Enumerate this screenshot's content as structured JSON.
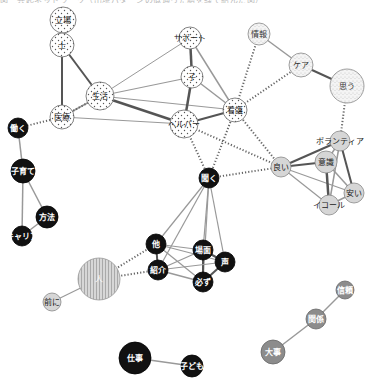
{
  "caption": "図　共起ネットワーク（出現パターンの似通った語を線で結んだ図）",
  "legend_patterns": {
    "dotted": "#ffffff",
    "stippled": "#f2f2f2",
    "light_gray": "#d6d6d6",
    "black": "#111111",
    "striped": "#c9c9c9",
    "medium_gray": "#8c8c8c"
  },
  "nodes": [
    {
      "id": "tachiba",
      "label": "立場",
      "x": 63,
      "y": 20,
      "r": 13,
      "style": "dotted"
    },
    {
      "id": "shi",
      "label": "士",
      "x": 62,
      "y": 45,
      "r": 12,
      "style": "dotted"
    },
    {
      "id": "seikatsu",
      "label": "生活",
      "x": 100,
      "y": 96,
      "r": 14,
      "style": "dotted"
    },
    {
      "id": "iryou",
      "label": "医療",
      "x": 62,
      "y": 117,
      "r": 12,
      "style": "dotted"
    },
    {
      "id": "support",
      "label": "サポート",
      "x": 190,
      "y": 38,
      "r": 11,
      "style": "dotted"
    },
    {
      "id": "ko",
      "label": "子",
      "x": 192,
      "y": 77,
      "r": 11,
      "style": "dotted"
    },
    {
      "id": "kango",
      "label": "看護",
      "x": 235,
      "y": 110,
      "r": 12,
      "style": "dotted"
    },
    {
      "id": "helper",
      "label": "ヘルパー",
      "x": 184,
      "y": 124,
      "r": 14,
      "style": "dotted"
    },
    {
      "id": "jouhou",
      "label": "情報",
      "x": 259,
      "y": 34,
      "r": 11,
      "style": "stippled"
    },
    {
      "id": "care",
      "label": "ケア",
      "x": 301,
      "y": 65,
      "r": 12,
      "style": "stippled"
    },
    {
      "id": "omou",
      "label": "思う",
      "x": 347,
      "y": 86,
      "r": 17,
      "style": "stippled"
    },
    {
      "id": "hataraku",
      "label": "働く",
      "x": 18,
      "y": 128,
      "r": 10,
      "style": "black"
    },
    {
      "id": "kosodate",
      "label": "子育て",
      "x": 23,
      "y": 171,
      "r": 12,
      "style": "black"
    },
    {
      "id": "houhou",
      "label": "方法",
      "x": 47,
      "y": 217,
      "r": 11,
      "style": "black"
    },
    {
      "id": "career",
      "label": "キャリア",
      "x": 22,
      "y": 236,
      "r": 10,
      "style": "black"
    },
    {
      "id": "yoi",
      "label": "良い",
      "x": 281,
      "y": 167,
      "r": 10,
      "style": "light_gray"
    },
    {
      "id": "volunteer",
      "label": "ボランティア",
      "x": 340,
      "y": 141,
      "r": 10,
      "style": "light_gray"
    },
    {
      "id": "ishiki",
      "label": "意識",
      "x": 326,
      "y": 162,
      "r": 11,
      "style": "light_gray"
    },
    {
      "id": "yasui",
      "label": "安い",
      "x": 354,
      "y": 193,
      "r": 10,
      "style": "light_gray"
    },
    {
      "id": "equal",
      "label": "イコール",
      "x": 329,
      "y": 205,
      "r": 10,
      "style": "light_gray"
    },
    {
      "id": "kiku",
      "label": "聞く",
      "x": 209,
      "y": 178,
      "r": 10,
      "style": "black"
    },
    {
      "id": "hoka",
      "label": "他",
      "x": 156,
      "y": 244,
      "r": 10,
      "style": "black"
    },
    {
      "id": "bamen",
      "label": "場面",
      "x": 203,
      "y": 250,
      "r": 10,
      "style": "black"
    },
    {
      "id": "koe",
      "label": "声",
      "x": 225,
      "y": 262,
      "r": 10,
      "style": "black"
    },
    {
      "id": "shoukai",
      "label": "紹介",
      "x": 158,
      "y": 270,
      "r": 10,
      "style": "black"
    },
    {
      "id": "kanarazu",
      "label": "必ず",
      "x": 203,
      "y": 282,
      "r": 10,
      "style": "black"
    },
    {
      "id": "hito",
      "label": "人",
      "x": 99,
      "y": 279,
      "r": 21,
      "style": "striped"
    },
    {
      "id": "maeni",
      "label": "前に",
      "x": 52,
      "y": 302,
      "r": 9,
      "style": "light_gray"
    },
    {
      "id": "shigoto",
      "label": "仕事",
      "x": 135,
      "y": 358,
      "r": 16,
      "style": "black"
    },
    {
      "id": "kodomo",
      "label": "子ども",
      "x": 192,
      "y": 366,
      "r": 11,
      "style": "black"
    },
    {
      "id": "shinrai",
      "label": "信頼",
      "x": 345,
      "y": 290,
      "r": 9,
      "style": "medium_gray"
    },
    {
      "id": "kankei",
      "label": "関係",
      "x": 316,
      "y": 319,
      "r": 10,
      "style": "medium_gray"
    },
    {
      "id": "daiji",
      "label": "大事",
      "x": 273,
      "y": 352,
      "r": 12,
      "style": "medium_gray"
    }
  ],
  "edges": [
    {
      "a": "tachiba",
      "b": "shi",
      "type": "solid",
      "w": 1.2
    },
    {
      "a": "shi",
      "b": "iryou",
      "type": "solid",
      "w": 2
    },
    {
      "a": "shi",
      "b": "seikatsu",
      "type": "solid",
      "w": 2
    },
    {
      "a": "seikatsu",
      "b": "iryou",
      "type": "solid",
      "w": 1.5
    },
    {
      "a": "seikatsu",
      "b": "helper",
      "type": "solid",
      "w": 2.4
    },
    {
      "a": "seikatsu",
      "b": "kango",
      "type": "solid",
      "w": 1.2
    },
    {
      "a": "seikatsu",
      "b": "ko",
      "type": "solid",
      "w": 1.2
    },
    {
      "a": "seikatsu",
      "b": "support",
      "type": "solid",
      "w": 1
    },
    {
      "a": "iryou",
      "b": "helper",
      "type": "solid",
      "w": 1
    },
    {
      "a": "support",
      "b": "ko",
      "type": "solid",
      "w": 2.5
    },
    {
      "a": "support",
      "b": "kango",
      "type": "solid",
      "w": 1.5
    },
    {
      "a": "ko",
      "b": "helper",
      "type": "solid",
      "w": 2.5
    },
    {
      "a": "ko",
      "b": "kango",
      "type": "solid",
      "w": 1.5
    },
    {
      "a": "helper",
      "b": "kango",
      "type": "solid",
      "w": 2
    },
    {
      "a": "jouhou",
      "b": "care",
      "type": "solid",
      "w": 1.5
    },
    {
      "a": "care",
      "b": "omou",
      "type": "solid",
      "w": 2
    },
    {
      "a": "hataraku",
      "b": "kosodate",
      "type": "solid",
      "w": 1.5
    },
    {
      "a": "kosodate",
      "b": "houhou",
      "type": "solid",
      "w": 1.5
    },
    {
      "a": "kosodate",
      "b": "career",
      "type": "solid",
      "w": 1.5
    },
    {
      "a": "houhou",
      "b": "career",
      "type": "solid",
      "w": 1.5
    },
    {
      "a": "yoi",
      "b": "ishiki",
      "type": "solid",
      "w": 2.2
    },
    {
      "a": "yoi",
      "b": "volunteer",
      "type": "solid",
      "w": 2
    },
    {
      "a": "yoi",
      "b": "yasui",
      "type": "solid",
      "w": 1.2
    },
    {
      "a": "yoi",
      "b": "equal",
      "type": "solid",
      "w": 1.2
    },
    {
      "a": "volunteer",
      "b": "ishiki",
      "type": "solid",
      "w": 1.5
    },
    {
      "a": "volunteer",
      "b": "yasui",
      "type": "solid",
      "w": 2
    },
    {
      "a": "volunteer",
      "b": "equal",
      "type": "solid",
      "w": 1.5
    },
    {
      "a": "ishiki",
      "b": "yasui",
      "type": "solid",
      "w": 1.5
    },
    {
      "a": "ishiki",
      "b": "equal",
      "type": "solid",
      "w": 2.5
    },
    {
      "a": "yasui",
      "b": "equal",
      "type": "solid",
      "w": 1.5
    },
    {
      "a": "kiku",
      "b": "hoka",
      "type": "solid",
      "w": 1.2
    },
    {
      "a": "kiku",
      "b": "bamen",
      "type": "solid",
      "w": 1.2
    },
    {
      "a": "kiku",
      "b": "koe",
      "type": "solid",
      "w": 1.2
    },
    {
      "a": "kiku",
      "b": "shoukai",
      "type": "solid",
      "w": 1.2
    },
    {
      "a": "kiku",
      "b": "kanarazu",
      "type": "solid",
      "w": 1.2
    },
    {
      "a": "hoka",
      "b": "bamen",
      "type": "solid",
      "w": 1.2
    },
    {
      "a": "hoka",
      "b": "shoukai",
      "type": "solid",
      "w": 2
    },
    {
      "a": "hoka",
      "b": "koe",
      "type": "solid",
      "w": 1.2
    },
    {
      "a": "hoka",
      "b": "kanarazu",
      "type": "solid",
      "w": 1.2
    },
    {
      "a": "bamen",
      "b": "koe",
      "type": "solid",
      "w": 2
    },
    {
      "a": "bamen",
      "b": "kanarazu",
      "type": "solid",
      "w": 2
    },
    {
      "a": "bamen",
      "b": "shoukai",
      "type": "solid",
      "w": 1.2
    },
    {
      "a": "koe",
      "b": "kanarazu",
      "type": "solid",
      "w": 2
    },
    {
      "a": "koe",
      "b": "shoukai",
      "type": "solid",
      "w": 1.2
    },
    {
      "a": "shoukai",
      "b": "kanarazu",
      "type": "solid",
      "w": 1.5
    },
    {
      "a": "hito",
      "b": "maeni",
      "type": "solid",
      "w": 1.2
    },
    {
      "a": "shigoto",
      "b": "kodomo",
      "type": "solid",
      "w": 1.5
    },
    {
      "a": "shinrai",
      "b": "kankei",
      "type": "solid",
      "w": 1.5
    },
    {
      "a": "kankei",
      "b": "daiji",
      "type": "solid",
      "w": 1.5
    },
    {
      "a": "hataraku",
      "b": "iryou",
      "type": "dotted"
    },
    {
      "a": "iryou",
      "b": "seikatsu",
      "type": "dotted"
    },
    {
      "a": "jouhou",
      "b": "kango",
      "type": "dotted"
    },
    {
      "a": "care",
      "b": "kango",
      "type": "dotted"
    },
    {
      "a": "omou",
      "b": "volunteer",
      "type": "dotted"
    },
    {
      "a": "kango",
      "b": "yoi",
      "type": "dotted"
    },
    {
      "a": "helper",
      "b": "yoi",
      "type": "dotted"
    },
    {
      "a": "kango",
      "b": "kiku",
      "type": "dotted"
    },
    {
      "a": "helper",
      "b": "kiku",
      "type": "dotted"
    },
    {
      "a": "yoi",
      "b": "kiku",
      "type": "dotted"
    },
    {
      "a": "hito",
      "b": "hoka",
      "type": "dotted"
    },
    {
      "a": "hito",
      "b": "shoukai",
      "type": "dotted"
    }
  ]
}
